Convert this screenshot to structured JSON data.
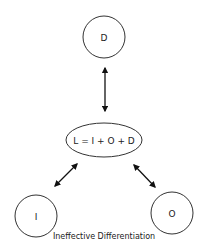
{
  "diagram": {
    "nodes": {
      "d": {
        "label": "D"
      },
      "center": {
        "label": "L = I + O + D"
      },
      "i": {
        "label": "I"
      },
      "o": {
        "label": "O"
      }
    },
    "edges": [
      {
        "from": "D",
        "to": "L = I + O + D",
        "type": "bidirectional"
      },
      {
        "from": "L = I + O + D",
        "to": "I",
        "type": "bidirectional"
      },
      {
        "from": "L = I + O + D",
        "to": "O",
        "type": "bidirectional"
      }
    ],
    "caption": "Ineffective Differentiation"
  }
}
